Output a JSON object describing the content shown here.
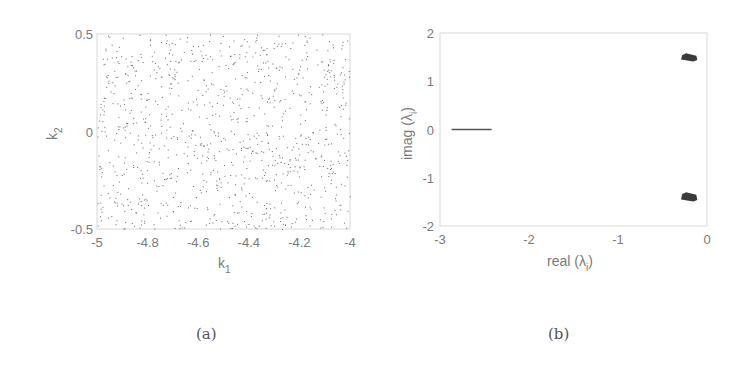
{
  "chart_data": [
    {
      "id": "a",
      "type": "scatter",
      "caption": "(a)",
      "title": "",
      "xlabel": "k1",
      "xlabel_main": "k",
      "xlabel_sub": "1",
      "ylabel": "k2",
      "ylabel_main": "k",
      "ylabel_sub": "2",
      "xlim": [
        -5,
        -4
      ],
      "ylim": [
        -0.5,
        0.5
      ],
      "xticks": [
        "-5",
        "-4.8",
        "-4.6",
        "-4.4",
        "-4.2",
        "-4"
      ],
      "yticks": [
        "-0.5",
        "0",
        "0.5"
      ],
      "grid": false,
      "description": "Uniform random scatter of ~1000 points over k1 in [-5,-4], k2 in [-0.5,0.5]",
      "n_points_approx": 1000
    },
    {
      "id": "b",
      "type": "scatter",
      "caption": "(b)",
      "title": "",
      "xlabel": "real (λi)",
      "xlabel_main": "real (λ",
      "xlabel_sub": "i",
      "xlabel_end": ")",
      "ylabel": "imag (λi)",
      "ylabel_main": "imag (λ",
      "ylabel_sub": "i",
      "ylabel_end": ")",
      "xlim": [
        -3,
        0
      ],
      "ylim": [
        -2,
        2
      ],
      "xticks": [
        "-3",
        "-2",
        "-1",
        "0"
      ],
      "yticks": [
        "-2",
        "-1",
        "0",
        "1",
        "2"
      ],
      "grid": false,
      "series": [
        {
          "name": "real eigenvalues",
          "shape": "line segment",
          "x_range": [
            -2.87,
            -2.42
          ],
          "y": 0
        },
        {
          "name": "complex eigenvalues (upper)",
          "shape": "cluster",
          "x_range": [
            -0.28,
            -0.12
          ],
          "y_range": [
            1.42,
            1.56
          ],
          "center": [
            -0.2,
            1.48
          ]
        },
        {
          "name": "complex eigenvalues (lower)",
          "shape": "cluster",
          "x_range": [
            -0.28,
            -0.12
          ],
          "y_range": [
            -1.48,
            -1.32
          ],
          "center": [
            -0.2,
            -1.4
          ]
        }
      ]
    }
  ]
}
